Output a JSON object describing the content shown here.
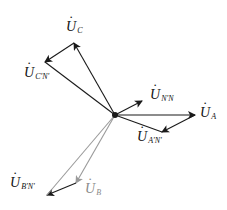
{
  "diagram": {
    "origin": {
      "x": 115,
      "y": 115
    },
    "colors": {
      "dark": "#1a1a1a",
      "gray": "#9a9a9a",
      "background": "#ffffff"
    },
    "vectors": [
      {
        "id": "U_C",
        "from": [
          115,
          115
        ],
        "to": [
          74,
          43
        ],
        "color": "#1a1a1a"
      },
      {
        "id": "U_C'N'",
        "from": [
          74,
          43
        ],
        "to": [
          45,
          62
        ],
        "color": "#1a1a1a"
      },
      {
        "id": "U_C'N'_from_origin",
        "from": [
          115,
          115
        ],
        "to": [
          45,
          62
        ],
        "color": "#1a1a1a",
        "arrow": false
      },
      {
        "id": "U_N'N",
        "from": [
          115,
          115
        ],
        "to": [
          142,
          101
        ],
        "color": "#1a1a1a"
      },
      {
        "id": "U_A",
        "from": [
          115,
          115
        ],
        "to": [
          195,
          115
        ],
        "color": "#1a1a1a"
      },
      {
        "id": "U_A'N'",
        "from": [
          195,
          115
        ],
        "to": [
          162,
          132
        ],
        "color": "#1a1a1a"
      },
      {
        "id": "U_A'N'_from_origin",
        "from": [
          115,
          115
        ],
        "to": [
          162,
          132
        ],
        "color": "#1a1a1a",
        "arrow": false
      },
      {
        "id": "U_B",
        "from": [
          115,
          115
        ],
        "to": [
          76,
          183
        ],
        "color": "#9a9a9a"
      },
      {
        "id": "U_B'N'",
        "from": [
          76,
          183
        ],
        "to": [
          47,
          195
        ],
        "color": "#1a1a1a"
      },
      {
        "id": "U_B'N'_from_origin",
        "from": [
          115,
          115
        ],
        "to": [
          47,
          195
        ],
        "color": "#9a9a9a",
        "arrow": false
      }
    ],
    "labels": {
      "uc": {
        "main": "U",
        "sub": "C"
      },
      "ucn": {
        "main": "U",
        "sub": "C'N'"
      },
      "unn": {
        "main": "U",
        "sub": "N'N"
      },
      "ua": {
        "main": "U",
        "sub": "A"
      },
      "uan": {
        "main": "U",
        "sub": "A'N'"
      },
      "ubn": {
        "main": "U",
        "sub": "B'N'"
      },
      "ub": {
        "main": "U",
        "sub": "B"
      }
    }
  }
}
